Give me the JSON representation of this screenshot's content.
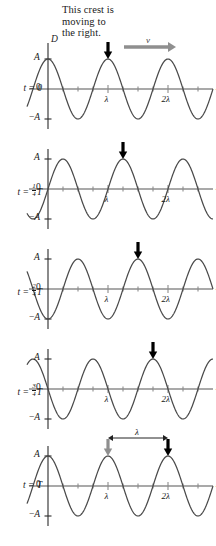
{
  "figure": {
    "caption_lines": [
      "This crest is",
      "moving to",
      "the right."
    ],
    "velocity_label": "v",
    "x_axis_label_var": "x",
    "x_axis_label_unit": "(m)",
    "displacement_axis_label": "D",
    "amplitude_label": "A",
    "negative_amplitude_label": "−A",
    "zero_label": "0",
    "wavelength_tick_1": "λ",
    "wavelength_tick_2": "2λ",
    "shift_span_label": "λ"
  },
  "colors": {
    "curve": "#4a4a4a",
    "axis": "#8c8c8c",
    "arrow_black": "#000000",
    "arrow_gray": "#8f8f8f",
    "text": "#1a1a1a"
  },
  "panels": [
    {
      "id": "panel-t0",
      "time_prefix": "t",
      "time_equals": "=",
      "time_value": "0",
      "time_has_fraction": false,
      "fraction_num": "",
      "fraction_den": "",
      "time_suffix": "",
      "phase_shift_fraction": 0,
      "show_D_label": true,
      "show_velocity_arrow": true,
      "show_span_arrow": false,
      "show_gray_arrow": false,
      "crest_arrow_x_label": "λ"
    },
    {
      "id": "panel-t-quarter",
      "time_prefix": "t",
      "time_equals": "=",
      "time_value": "",
      "time_has_fraction": true,
      "fraction_num": "1",
      "fraction_den": "4",
      "time_suffix": "T",
      "phase_shift_fraction": 0.25,
      "show_D_label": false,
      "show_velocity_arrow": false,
      "show_span_arrow": false,
      "show_gray_arrow": false,
      "crest_arrow_x_label": "λ"
    },
    {
      "id": "panel-t-half",
      "time_prefix": "t",
      "time_equals": "=",
      "time_value": "",
      "time_has_fraction": true,
      "fraction_num": "2",
      "fraction_den": "4",
      "time_suffix": "T",
      "phase_shift_fraction": 0.5,
      "show_D_label": false,
      "show_velocity_arrow": false,
      "show_span_arrow": false,
      "show_gray_arrow": false,
      "crest_arrow_x_label": "λ"
    },
    {
      "id": "panel-t-three-quarter",
      "time_prefix": "t",
      "time_equals": "=",
      "time_value": "",
      "time_has_fraction": true,
      "fraction_num": "3",
      "fraction_den": "4",
      "time_suffix": "T",
      "phase_shift_fraction": 0.75,
      "show_D_label": false,
      "show_velocity_arrow": false,
      "show_span_arrow": false,
      "show_gray_arrow": false,
      "crest_arrow_x_label": "λ"
    },
    {
      "id": "panel-t-full",
      "time_prefix": "t",
      "time_equals": "=",
      "time_value": "T",
      "time_has_fraction": false,
      "fraction_num": "",
      "fraction_den": "",
      "time_suffix": "",
      "phase_shift_fraction": 1.0,
      "show_D_label": false,
      "show_velocity_arrow": false,
      "show_span_arrow": true,
      "show_gray_arrow": true,
      "crest_arrow_x_label": "λ"
    }
  ],
  "chart_data": {
    "type": "line",
    "xlabel": "x (m)",
    "ylabel": "D",
    "function": "D(x,t) = A cos(2π(x/λ − t/T))",
    "amplitude": 1.0,
    "wavelength_units": "λ",
    "x_range_in_wavelengths": [
      -0.35,
      2.75
    ],
    "x_tick_labels": [
      "λ",
      "2λ"
    ],
    "x_tick_positions_in_wavelengths": [
      1,
      2
    ],
    "y_tick_labels": [
      "A",
      "0",
      "−A"
    ],
    "y_tick_values": [
      1,
      0,
      -1
    ],
    "minor_ticks_per_wavelength": 4,
    "grid": false,
    "legend": false,
    "series": [
      {
        "name": "t = 0",
        "phase_shift_in_wavelengths": 0.0,
        "tracked_crest_x": 1.0
      },
      {
        "name": "t = 1/4T",
        "phase_shift_in_wavelengths": 0.25,
        "tracked_crest_x": 1.25
      },
      {
        "name": "t = 2/4T",
        "phase_shift_in_wavelengths": 0.5,
        "tracked_crest_x": 1.5
      },
      {
        "name": "t = 3/4T",
        "phase_shift_in_wavelengths": 0.75,
        "tracked_crest_x": 1.75
      },
      {
        "name": "t = T",
        "phase_shift_in_wavelengths": 1.0,
        "tracked_crest_x": 2.0
      }
    ],
    "annotations": [
      {
        "text": "This crest is moving to the right.",
        "points_to": "crest at x = λ on t = 0"
      },
      {
        "text": "v",
        "type": "velocity-arrow",
        "direction": "right"
      },
      {
        "text": "λ",
        "type": "span-arrow",
        "from_x": 1.0,
        "to_x": 2.0,
        "panel": "t = T"
      }
    ]
  }
}
